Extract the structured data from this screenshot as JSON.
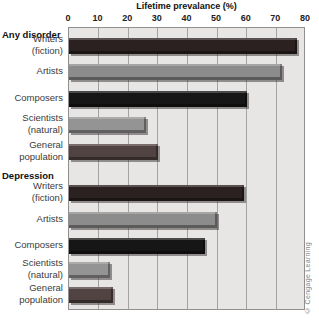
{
  "title": "Lifetime prevalance (%)",
  "credit": "© Cengage Learning",
  "colors": {
    "writers": "#2b2121",
    "artists": "#8c8c8c",
    "composers": "#161616",
    "scientists": "#949494",
    "general_population": "#524343",
    "plot_background": "#e7e6e4",
    "gridline": "#a3a3a3"
  },
  "chart_data": {
    "type": "bar",
    "orientation": "horizontal",
    "title": "Lifetime prevalance (%)",
    "xlabel": "Lifetime prevalance (%)",
    "xlim": [
      0,
      80
    ],
    "ticks": [
      0,
      10,
      20,
      30,
      40,
      50,
      60,
      70,
      80
    ],
    "grid": true,
    "legend": "none",
    "groups": [
      {
        "label": "Any disorder",
        "bars": [
          {
            "label": "Writers (fiction)",
            "label_lines": [
              "Writers",
              "(fiction)"
            ],
            "value": 77,
            "color_key": "writers"
          },
          {
            "label": "Artists",
            "label_lines": [
              "Artists"
            ],
            "value": 72,
            "color_key": "artists"
          },
          {
            "label": "Composers",
            "label_lines": [
              "Composers"
            ],
            "value": 60,
            "color_key": "composers"
          },
          {
            "label": "Scientists (natural)",
            "label_lines": [
              "Scientists",
              "(natural)"
            ],
            "value": 26,
            "color_key": "scientists"
          },
          {
            "label": "General population",
            "label_lines": [
              "General",
              "population"
            ],
            "value": 30,
            "color_key": "general_population"
          }
        ]
      },
      {
        "label": "Depression",
        "bars": [
          {
            "label": "Writers (fiction)",
            "label_lines": [
              "Writers",
              "(fiction)"
            ],
            "value": 59,
            "color_key": "writers"
          },
          {
            "label": "Artists",
            "label_lines": [
              "Artists"
            ],
            "value": 50,
            "color_key": "artists"
          },
          {
            "label": "Composers",
            "label_lines": [
              "Composers"
            ],
            "value": 46,
            "color_key": "composers"
          },
          {
            "label": "Scientists (natural)",
            "label_lines": [
              "Scientists",
              "(natural)"
            ],
            "value": 14,
            "color_key": "scientists"
          },
          {
            "label": "General population",
            "label_lines": [
              "General",
              "population"
            ],
            "value": 15,
            "color_key": "general_population"
          }
        ]
      }
    ]
  }
}
